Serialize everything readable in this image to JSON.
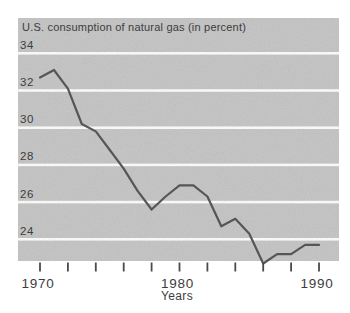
{
  "chart_data": {
    "type": "line",
    "title": "U.S. consumption of natural gas (in percent)",
    "xlabel": "Years",
    "ylabel": "",
    "x": [
      1970,
      1971,
      1972,
      1973,
      1974,
      1975,
      1976,
      1977,
      1978,
      1979,
      1980,
      1981,
      1982,
      1983,
      1984,
      1985,
      1986,
      1987,
      1988,
      1989,
      1990
    ],
    "values": [
      32.7,
      33.1,
      32.1,
      30.2,
      29.8,
      28.8,
      27.8,
      26.6,
      25.6,
      26.3,
      26.9,
      26.9,
      26.3,
      24.7,
      25.1,
      24.3,
      22.7,
      23.2,
      23.2,
      23.7,
      23.7
    ],
    "y_gridlines": [
      34,
      32,
      30,
      28,
      26,
      24
    ],
    "y_gridline_labels": [
      "34",
      "32",
      "30",
      "28",
      "26",
      "24"
    ],
    "x_tick_years": [
      1970,
      1972,
      1974,
      1976,
      1978,
      1980,
      1982,
      1984,
      1986,
      1988,
      1990
    ],
    "x_axis_labels": [
      {
        "year": 1970,
        "label": "1970"
      },
      {
        "year": 1980,
        "label": "1980"
      },
      {
        "year": 1990,
        "label": "1990"
      }
    ],
    "xlim": [
      1970,
      1990
    ],
    "ylim": [
      22.8,
      35.9
    ],
    "grid": "horizontal white gridlines over gray bands",
    "legend": "none",
    "colors": {
      "background": "#ffffff",
      "band": "#c9c9c9",
      "gridline": "#ffffff",
      "line": "#565656",
      "text": "#3d3d3d",
      "tick": "#4a4a4a"
    }
  }
}
